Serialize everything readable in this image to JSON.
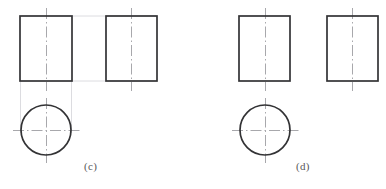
{
  "figure": {
    "type": "orthographic-projection-drawing",
    "background_color": "#ffffff",
    "outline_color": "#333335",
    "centerline_color": "#a8a8ac",
    "projection_line_color": "#d8d8dc",
    "label_color": "#58585a",
    "panels": [
      {
        "id": "c",
        "label": "(c)",
        "label_x": 84,
        "label_y": 160,
        "shapes": [
          {
            "name": "front-view-rectangle",
            "type": "rect",
            "x": 20,
            "y": 16,
            "width": 52,
            "height": 65,
            "stroke_width": 1.6
          },
          {
            "name": "side-view-rectangle",
            "type": "rect",
            "x": 106,
            "y": 16,
            "width": 51,
            "height": 65,
            "stroke_width": 1.6
          },
          {
            "name": "top-view-circle",
            "type": "circle",
            "cx": 46,
            "cy": 130,
            "r": 25,
            "stroke_width": 1.6
          }
        ],
        "centerlines": [
          {
            "name": "front-view-vertical-centerline",
            "x1": 46,
            "y1": 8,
            "x2": 46,
            "y2": 90
          },
          {
            "name": "side-view-vertical-centerline",
            "x1": 131,
            "y1": 8,
            "x2": 131,
            "y2": 90
          },
          {
            "name": "top-view-vertical-centerline",
            "x1": 46,
            "y1": 98,
            "x2": 46,
            "y2": 163
          },
          {
            "name": "top-view-horizontal-centerline",
            "x1": 13,
            "y1": 130,
            "x2": 80,
            "y2": 130
          }
        ],
        "projection_lines": [
          {
            "name": "projection-top-horizontal",
            "x1": 72,
            "y1": 16,
            "x2": 157,
            "y2": 16
          },
          {
            "name": "projection-bottom-horizontal",
            "x1": 72,
            "y1": 81,
            "x2": 157,
            "y2": 81
          },
          {
            "name": "projection-left-vertical",
            "x1": 20,
            "y1": 81,
            "x2": 20,
            "y2": 132
          },
          {
            "name": "projection-right-vertical",
            "x1": 72,
            "y1": 81,
            "x2": 72,
            "y2": 132
          }
        ]
      },
      {
        "id": "d",
        "label": "(d)",
        "label_x": 296,
        "label_y": 160,
        "shapes": [
          {
            "name": "front-view-rectangle",
            "type": "rect",
            "x": 239,
            "y": 16,
            "width": 51,
            "height": 65,
            "stroke_width": 1.6
          },
          {
            "name": "side-view-rectangle",
            "type": "rect",
            "x": 327,
            "y": 16,
            "width": 51,
            "height": 65,
            "stroke_width": 1.6
          },
          {
            "name": "top-view-circle",
            "type": "circle",
            "cx": 265,
            "cy": 130,
            "r": 25,
            "stroke_width": 1.6
          }
        ],
        "centerlines": [
          {
            "name": "front-view-vertical-centerline",
            "x1": 265,
            "y1": 8,
            "x2": 265,
            "y2": 90
          },
          {
            "name": "side-view-vertical-centerline",
            "x1": 352,
            "y1": 8,
            "x2": 352,
            "y2": 90
          },
          {
            "name": "top-view-vertical-centerline",
            "x1": 265,
            "y1": 98,
            "x2": 265,
            "y2": 163
          },
          {
            "name": "top-view-horizontal-centerline",
            "x1": 232,
            "y1": 130,
            "x2": 299,
            "y2": 130
          }
        ],
        "projection_lines": []
      }
    ]
  }
}
